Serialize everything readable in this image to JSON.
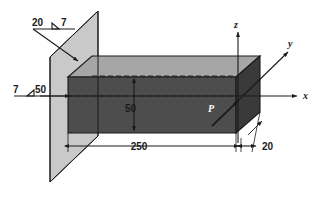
{
  "figure": {
    "background_color": "#ffffff"
  },
  "colors": {
    "wall_plane": "#c9c9c9",
    "beam_top_face": "#a6a6a6",
    "beam_front_face": "#4d4d4d",
    "beam_end_face": "#3a3a3a",
    "line": "#1a1a1a",
    "text": "#1a1a1a",
    "point_label": "#ffffff"
  },
  "weld_symbols": [
    {
      "id": "upper-weld-symbol",
      "leg_size": "20",
      "throat_size": "7",
      "symbol_glyph": "fillet-weld-triangle",
      "position": "upper-left",
      "leader_target": "beam-top-weld-joint"
    },
    {
      "id": "lower-weld-symbol",
      "leg_size": "7",
      "throat_size": "50",
      "symbol_glyph": "fillet-weld-triangle",
      "position": "left-middle",
      "leader_target": "beam-side-weld-joint"
    }
  ],
  "dimensions": [
    {
      "id": "length-dimension",
      "value": "250",
      "orientation": "horizontal",
      "describes": "beam length along x-axis"
    },
    {
      "id": "height-dimension",
      "value": "50",
      "orientation": "vertical",
      "describes": "beam height along z-axis"
    },
    {
      "id": "width-dimension",
      "value": "20",
      "orientation": "oblique",
      "describes": "beam width along y-axis"
    }
  ],
  "axes": [
    {
      "id": "axis-x",
      "label": "x",
      "direction": "right"
    },
    {
      "id": "axis-y",
      "label": "y",
      "direction": "upper-right-oblique"
    },
    {
      "id": "axis-z",
      "label": "z",
      "direction": "up"
    }
  ],
  "points": [
    {
      "id": "point-p",
      "label": "P",
      "description": "point on beam free-end face at origin of axes"
    }
  ]
}
